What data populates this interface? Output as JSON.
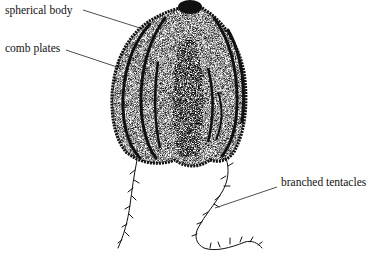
{
  "diagram": {
    "labels": [
      {
        "id": "spherical-body",
        "text": "spherical body"
      },
      {
        "id": "comb-plates",
        "text": "comb plates"
      },
      {
        "id": "branched-tentacles",
        "text": "branched tentacles"
      }
    ]
  }
}
